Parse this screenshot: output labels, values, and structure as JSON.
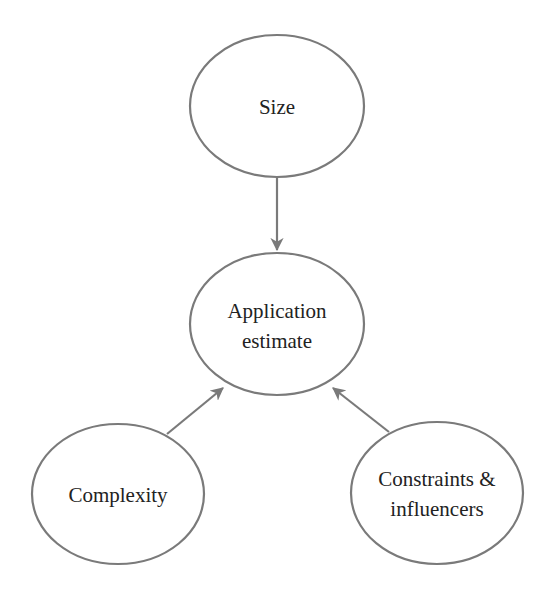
{
  "diagram": {
    "type": "influence-diagram",
    "nodes": [
      {
        "id": "size",
        "lines": [
          "Size"
        ],
        "cx": 277,
        "cy": 106,
        "rx": 87,
        "ry": 71
      },
      {
        "id": "application-estimate",
        "lines": [
          "Application",
          "estimate"
        ],
        "cx": 277,
        "cy": 324,
        "rx": 87,
        "ry": 71
      },
      {
        "id": "complexity",
        "lines": [
          "Complexity"
        ],
        "cx": 118,
        "cy": 494,
        "rx": 86,
        "ry": 70
      },
      {
        "id": "constraints-influencers",
        "lines": [
          "Constraints &",
          "influencers"
        ],
        "cx": 437,
        "cy": 493,
        "rx": 86,
        "ry": 71
      }
    ],
    "edges": [
      {
        "from": "size",
        "to": "application-estimate"
      },
      {
        "from": "complexity",
        "to": "application-estimate"
      },
      {
        "from": "constraints-influencers",
        "to": "application-estimate"
      }
    ],
    "colors": {
      "stroke": "#7a7a7a",
      "text": "#222222",
      "background": "#ffffff"
    }
  }
}
